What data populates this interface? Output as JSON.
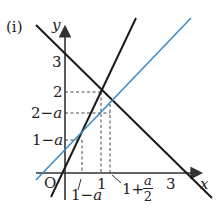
{
  "figure": {
    "label": "(i)",
    "axes": {
      "x_label": "x",
      "y_label": "y",
      "origin_label": "O"
    },
    "x_ticks": [
      "1-a",
      "1",
      "1+a/2",
      "3"
    ],
    "x_tick_parts": {
      "one_minus_a_prefix": "1−",
      "one_minus_a_var": "a",
      "one": "1",
      "one_plus_prefix": "1+",
      "frac_num": "a",
      "frac_den": "2",
      "three": "3"
    },
    "y_ticks": [
      "1-a",
      "2-a",
      "2",
      "3"
    ],
    "y_tick_parts": {
      "three": "3",
      "two": "2",
      "two_minus_prefix": "2−",
      "two_minus_var": "a",
      "one_minus_prefix": "1−",
      "one_minus_var": "a"
    },
    "colors": {
      "black_lines": "#1a1a1a",
      "blue_line": "#3d8cc7",
      "dashed": "#444444"
    },
    "lines": [
      {
        "name": "y = -x + 3",
        "color": "black"
      },
      {
        "name": "y = 2x",
        "color": "black"
      },
      {
        "name": "y = x + 1 - a",
        "color": "blue"
      }
    ],
    "points": [
      {
        "label": "(1, 2)",
        "x": 1,
        "y": 2
      },
      {
        "label": "(1-a, 2-2a)",
        "x": "1-a",
        "y": "2-2a"
      },
      {
        "label": "(1+a/2, 2-a/2)",
        "x": "1+a/2",
        "y": "2-a/2"
      }
    ]
  }
}
